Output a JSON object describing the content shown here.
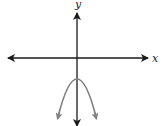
{
  "diagram": {
    "axes": {
      "x_label": "x",
      "y_label": "y"
    },
    "curve": {
      "type": "parabola",
      "opens": "down",
      "vertex_position": "on y-axis, below origin",
      "color": "#808080"
    },
    "colors": {
      "axis": "#1a1a1a",
      "curve": "#808080",
      "background": "#ffffff"
    }
  }
}
